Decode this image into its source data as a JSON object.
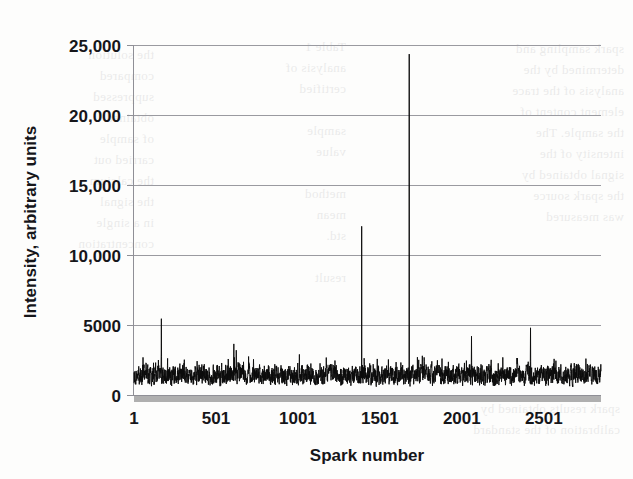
{
  "figure": {
    "kind": "scanned-chart",
    "background_color": "#fdfdfc",
    "ink_color": "#0c0c0c",
    "gridline_color": "#9a9aa0",
    "baseline_smudge_color": "#a8a8a8"
  },
  "chart_data": {
    "type": "line",
    "title": "",
    "subtitle": "",
    "xlabel": "Spark number",
    "ylabel": "Intensity, arbitrary units",
    "xlim": [
      1,
      2850
    ],
    "ylim": [
      0,
      25000
    ],
    "xticks": [
      1,
      501,
      1001,
      1501,
      2001,
      2501
    ],
    "xtick_labels": [
      "1",
      "501",
      "1001",
      "1501",
      "2001",
      "2501"
    ],
    "yticks": [
      0,
      5000,
      10000,
      15000,
      20000,
      25000
    ],
    "ytick_labels": [
      "0",
      "5000",
      "10,000",
      "15,000",
      "20,000",
      "25,000"
    ],
    "grid": "horizontal",
    "legend": "none",
    "series": [
      {
        "name": "Spark intensity",
        "color": "#0c0c0c",
        "description": "Per-spark emission intensity trace: a dense noise band around 1400 arbitrary units with several isolated high-intensity spikes.",
        "baseline_mean": 1400,
        "baseline_min": 500,
        "baseline_max": 2400,
        "n_points": 2850,
        "peaks": [
          {
            "x": 30,
            "y": 2050
          },
          {
            "x": 120,
            "y": 2300
          },
          {
            "x": 150,
            "y": 2500
          },
          {
            "x": 168,
            "y": 5450
          },
          {
            "x": 205,
            "y": 2100
          },
          {
            "x": 300,
            "y": 2150
          },
          {
            "x": 430,
            "y": 2200
          },
          {
            "x": 560,
            "y": 2150
          },
          {
            "x": 610,
            "y": 3650
          },
          {
            "x": 625,
            "y": 3200
          },
          {
            "x": 700,
            "y": 2750
          },
          {
            "x": 730,
            "y": 2550
          },
          {
            "x": 860,
            "y": 2200
          },
          {
            "x": 1010,
            "y": 2900
          },
          {
            "x": 1080,
            "y": 2250
          },
          {
            "x": 1200,
            "y": 2200
          },
          {
            "x": 1390,
            "y": 12050
          },
          {
            "x": 1460,
            "y": 2200
          },
          {
            "x": 1600,
            "y": 2350
          },
          {
            "x": 1680,
            "y": 24350
          },
          {
            "x": 1730,
            "y": 2700
          },
          {
            "x": 1760,
            "y": 2800
          },
          {
            "x": 1880,
            "y": 2600
          },
          {
            "x": 2060,
            "y": 4200
          },
          {
            "x": 2180,
            "y": 2300
          },
          {
            "x": 2420,
            "y": 4800
          },
          {
            "x": 2560,
            "y": 2250
          },
          {
            "x": 2700,
            "y": 2200
          }
        ]
      }
    ]
  },
  "bleed_through_text": {
    "left": "the solution\ncompared\nsuppressed\nobtained\nof sample\ncarried out\nthe calcium\nthe signal\nin a single\nconcentration",
    "middle": "Table 1\nanalysis of\ncertified\n\nsample\nvalue\n\nmethod\nmean\nstd.\n\nresult",
    "right": "spark sampling and\ndetermined by the\nanalysis of the trace\nelement content of\nthe sample. The\nintensity of the\nsignal obtained by\nthe spark source\nwas measured",
    "bottom": "spark results obtained by\ncalibration of the standard"
  }
}
